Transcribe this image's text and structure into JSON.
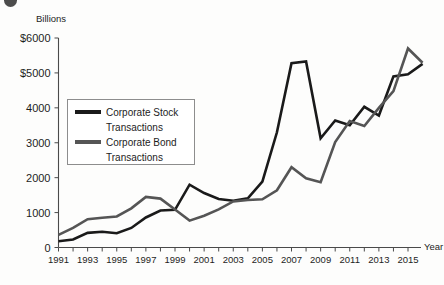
{
  "chart_data": {
    "type": "line",
    "title": "",
    "xlabel": "Year",
    "ylabel": "Billions",
    "y_axis_unit_label": "Billions",
    "x_axis_label": "Year",
    "xlim": [
      1991,
      2016
    ],
    "ylim": [
      0,
      6000
    ],
    "grid": false,
    "legend_position": "upper-left-inside",
    "y_ticks": [
      {
        "value": 6000,
        "label": "$6000"
      },
      {
        "value": 5000,
        "label": "$5000"
      },
      {
        "value": 4000,
        "label": "4000"
      },
      {
        "value": 3000,
        "label": "3000"
      },
      {
        "value": 2000,
        "label": "2000"
      },
      {
        "value": 1000,
        "label": "1000"
      },
      {
        "value": 0,
        "label": "0"
      }
    ],
    "x_ticks": [
      1991,
      1992,
      1993,
      1994,
      1995,
      1996,
      1997,
      1998,
      1999,
      2000,
      2001,
      2002,
      2003,
      2004,
      2005,
      2006,
      2007,
      2008,
      2009,
      2010,
      2011,
      2012,
      2013,
      2014,
      2015,
      2016
    ],
    "x_tick_labels": [
      "1991",
      "",
      "1993",
      "",
      "1995",
      "",
      "1997",
      "",
      "1999",
      "",
      "2001",
      "",
      "2003",
      "",
      "2005",
      "",
      "2007",
      "",
      "2009",
      "",
      "2011",
      "",
      "2013",
      "",
      "2015",
      ""
    ],
    "x": [
      1991,
      1992,
      1993,
      1994,
      1995,
      1996,
      1997,
      1998,
      1999,
      2000,
      2001,
      2002,
      2003,
      2004,
      2005,
      2006,
      2007,
      2008,
      2009,
      2010,
      2011,
      2012,
      2013,
      2014,
      2015,
      2016
    ],
    "series": [
      {
        "name": "Corporate Stock Transactions",
        "color": "#1a1a1a",
        "width": 2.6,
        "values": [
          180,
          230,
          420,
          450,
          410,
          560,
          860,
          1060,
          1080,
          1800,
          1560,
          1390,
          1340,
          1410,
          1890,
          3300,
          5280,
          5330,
          3130,
          3640,
          3500,
          4030,
          3780,
          4900,
          4960,
          5260
        ]
      },
      {
        "name": "Corporate Bond Transactions",
        "color": "#555555",
        "width": 2.6,
        "values": [
          360,
          560,
          810,
          850,
          890,
          1120,
          1450,
          1400,
          1090,
          770,
          910,
          1090,
          1320,
          1360,
          1380,
          1640,
          2300,
          1980,
          1870,
          3020,
          3620,
          3480,
          4000,
          4480,
          5700,
          5290
        ]
      }
    ],
    "legend": [
      {
        "label_line1": "Corporate Stock",
        "label_line2": "Transactions",
        "color": "#1a1a1a"
      },
      {
        "label_line1": "Corporate Bond",
        "label_line2": "Transactions",
        "color": "#555555"
      }
    ]
  },
  "colors": {
    "stock": "#1a1a1a",
    "bond": "#555555",
    "axis": "#4a4a4a",
    "text": "#1d1d1d",
    "background": "#fdfdfc"
  }
}
